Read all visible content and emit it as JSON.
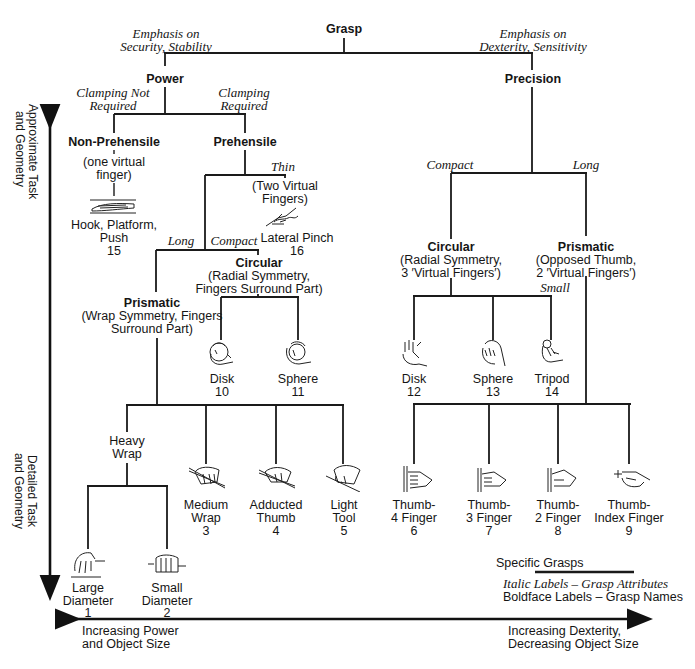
{
  "root": {
    "label": "Grasp"
  },
  "emphasis": {
    "left": [
      "Emphasis on",
      "Security, Stability"
    ],
    "right": [
      "Emphasis on",
      "Dexterity, Sensitivity"
    ]
  },
  "power": {
    "label": "Power",
    "attr_left": [
      "Clamping Not",
      "Required"
    ],
    "attr_right": [
      "Clamping",
      "Required"
    ],
    "non_prehensile": {
      "label": "Non-Prehensile",
      "desc": [
        "(one virtual",
        "finger)"
      ],
      "grasp": {
        "name": [
          "Hook, Platform,",
          "Push"
        ],
        "number": "15"
      }
    },
    "prehensile": {
      "label": "Prehensile",
      "thin": {
        "attr": "Thin",
        "desc": [
          "(Two Virtual",
          "Fingers)"
        ],
        "grasp": {
          "name": "Lateral Pinch",
          "number": "16"
        }
      },
      "attr_long": "Long",
      "attr_compact": "Compact",
      "circular": {
        "label": "Circular",
        "desc": [
          "(Radial Symmetry,",
          "Fingers Surround Part)"
        ],
        "grasps": [
          {
            "name": "Disk",
            "number": "10"
          },
          {
            "name": "Sphere",
            "number": "11"
          }
        ]
      },
      "prismatic": {
        "label": "Prismatic",
        "desc": [
          "(Wrap Symmetry, Fingers",
          "Surround Part)"
        ],
        "heavy_wrap": {
          "label": [
            "Heavy",
            "Wrap"
          ],
          "grasps": [
            {
              "name": [
                "Large",
                "Diameter"
              ],
              "number": "1"
            },
            {
              "name": [
                "Small",
                "Diameter"
              ],
              "number": "2"
            }
          ]
        },
        "grasps": [
          {
            "name": [
              "Medium",
              "Wrap"
            ],
            "number": "3"
          },
          {
            "name": [
              "Adducted",
              "Thumb"
            ],
            "number": "4"
          },
          {
            "name": [
              "Light",
              "Tool"
            ],
            "number": "5"
          }
        ]
      }
    }
  },
  "precision": {
    "label": "Precision",
    "attr_compact": "Compact",
    "attr_long": "Long",
    "circular": {
      "label": "Circular",
      "desc": [
        "(Radial Symmetry,",
        "3 ′Virtual Fingers′)"
      ],
      "attr_small": "Small",
      "grasps": [
        {
          "name": "Disk",
          "number": "12"
        },
        {
          "name": "Sphere",
          "number": "13"
        },
        {
          "name": "Tripod",
          "number": "14"
        }
      ]
    },
    "prismatic": {
      "label": "Prismatic",
      "desc": [
        "(Opposed Thumb,",
        "2 ′Virtual Fingers′)"
      ],
      "grasps": [
        {
          "name": [
            "Thumb-",
            "4 Finger"
          ],
          "number": "6"
        },
        {
          "name": [
            "Thumb-",
            "3 Finger"
          ],
          "number": "7"
        },
        {
          "name": [
            "Thumb-",
            "2 Finger"
          ],
          "number": "8"
        },
        {
          "name": [
            "Thumb-",
            "Index Finger"
          ],
          "number": "9"
        }
      ]
    }
  },
  "axes": {
    "vertical_top": [
      "Approximate Task",
      "and Geometry"
    ],
    "vertical_bottom": [
      "Detailed Task",
      "and Geometry"
    ],
    "horizontal_left": [
      "Increasing Power",
      "and Object Size"
    ],
    "horizontal_right": [
      "Increasing Dexterity,",
      "Decreasing Object Size"
    ]
  },
  "legend": {
    "specific": "Specific Grasps",
    "italic": "Italic Labels – Grasp Attributes",
    "bold": "Boldface Labels – Grasp Names"
  }
}
